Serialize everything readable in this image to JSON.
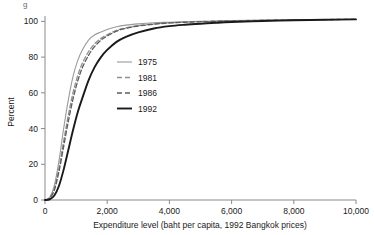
{
  "figure": {
    "caption_fragment": "g",
    "background_color": "#ffffff",
    "axis_color": "#8a8a8a",
    "text_color": "#1a1a1a"
  },
  "chart_data": {
    "type": "line",
    "title": "",
    "xlabel": "Expenditure level (baht per capita, 1992 Bangkok prices)",
    "ylabel": "Percent",
    "xlim": [
      0,
      10000
    ],
    "ylim": [
      0,
      103
    ],
    "grid": false,
    "legend_position": "inside-center-left",
    "xticks": [
      0,
      2000,
      4000,
      6000,
      8000,
      10000
    ],
    "xtick_labels": [
      "0",
      "2,000",
      "4,000",
      "6,000",
      "8,000",
      "10,000"
    ],
    "yticks": [
      0,
      20,
      40,
      60,
      80,
      100
    ],
    "ytick_labels": [
      "0",
      "20",
      "40",
      "60",
      "80",
      "100"
    ],
    "x": [
      0,
      150,
      300,
      450,
      600,
      750,
      900,
      1050,
      1200,
      1400,
      1600,
      1800,
      2000,
      2300,
      2600,
      3000,
      3500,
      4000,
      4500,
      5000,
      5500,
      6000,
      7000,
      8000,
      9000,
      10000
    ],
    "series": [
      {
        "name": "1975",
        "color": "#9a9a9a",
        "style": "solid",
        "width": 1.1,
        "values": [
          0,
          1.5,
          8,
          22,
          40,
          56,
          69,
          78,
          84,
          89.5,
          92.5,
          94,
          95.5,
          97,
          97.9,
          98.6,
          99.2,
          99.5,
          99.8,
          100,
          100.2,
          100.4,
          100.7,
          100.9,
          101,
          101.1
        ]
      },
      {
        "name": "1981",
        "color": "#8f8f8f",
        "style": "dashed",
        "width": 1.3,
        "values": [
          0,
          1.2,
          6.5,
          18,
          33,
          47.5,
          60,
          69.5,
          76.5,
          83,
          87.5,
          90.5,
          92.5,
          95,
          96.4,
          97.6,
          98.6,
          99.2,
          99.6,
          99.9,
          100.1,
          100.3,
          100.6,
          100.8,
          101,
          101.1
        ]
      },
      {
        "name": "1986",
        "color": "#5c5c5c",
        "style": "dashed",
        "width": 1.3,
        "values": [
          0,
          1.0,
          5.5,
          16,
          30,
          44,
          56.5,
          66.5,
          74,
          81,
          86,
          89.5,
          91.8,
          94.5,
          96.1,
          97.4,
          98.4,
          99.1,
          99.5,
          99.8,
          100.0,
          100.2,
          100.5,
          100.8,
          101,
          101.1
        ]
      },
      {
        "name": "1992",
        "color": "#1a1a1a",
        "style": "solid",
        "width": 1.9,
        "values": [
          0,
          0.4,
          2.5,
          8,
          17,
          28,
          39,
          49,
          57,
          67,
          74.5,
          80,
          84,
          88.5,
          91.3,
          93.8,
          96.0,
          97.3,
          98.1,
          98.7,
          99.2,
          99.6,
          100.2,
          100.6,
          100.9,
          101.1
        ]
      }
    ]
  }
}
